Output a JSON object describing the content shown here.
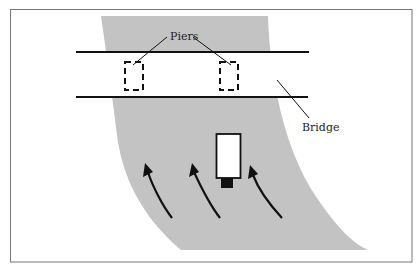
{
  "diagram": {
    "labels": {
      "piers": "Piers",
      "bridge": "Bridge"
    },
    "colors": {
      "river": "#c3c3c3",
      "frame": "#777777",
      "ink": "#111111",
      "background": "#ffffff",
      "truck_body": "#ffffff"
    },
    "elements": {
      "river": "Curving river/roadway shaded gray, bending right toward the bottom",
      "bridge": "Two parallel horizontal lines crossing the river",
      "piers": [
        "left-pier",
        "right-pier"
      ],
      "vehicle": "Rectangular vehicle (white box with black cab) heading toward the bridge",
      "flow_arrows": 3
    }
  }
}
